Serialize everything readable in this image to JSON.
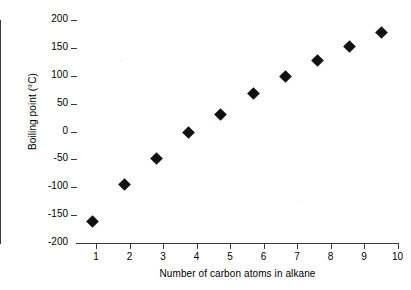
{
  "chart_data": {
    "type": "scatter",
    "title": "",
    "xlabel": "Number of carbon atoms in alkane",
    "ylabel": "Boiling point (°C)",
    "x": [
      1,
      2,
      3,
      4,
      5,
      6,
      7,
      8,
      9,
      10
    ],
    "values": [
      -162,
      -95,
      -49,
      -1,
      31,
      68,
      98,
      127,
      152,
      178
    ],
    "series": [
      {
        "name": "Boiling point",
        "values": [
          -162,
          -95,
          -49,
          -1,
          31,
          68,
          98,
          127,
          152,
          178
        ]
      }
    ],
    "xlim": [
      0.5,
      10.5
    ],
    "ylim": [
      -200,
      200
    ],
    "xticks": [
      "1",
      "2",
      "3",
      "4",
      "5",
      "6",
      "7",
      "8",
      "9",
      "10"
    ],
    "yticks": [
      "200",
      "150",
      "100",
      "50",
      "0",
      "-50",
      "-100",
      "-150",
      "-200"
    ],
    "ytick_values": [
      200,
      150,
      100,
      50,
      0,
      -50,
      -100,
      -150,
      -200
    ],
    "grid": false,
    "legend": false,
    "marker": "diamond",
    "marker_color": "#111111",
    "axis_color": "#3a3a3a",
    "background": "#ffffff"
  }
}
